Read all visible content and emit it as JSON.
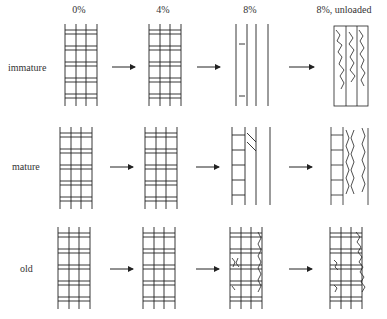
{
  "figure": {
    "columns": [
      {
        "label": "0%",
        "x": 70
      },
      {
        "label": "4%",
        "x": 163
      },
      {
        "label": "8%",
        "x": 250
      },
      {
        "label": "8%, unloaded",
        "x": 344
      }
    ],
    "rows": [
      {
        "label": "immature",
        "y": 65
      },
      {
        "label": "mature",
        "y": 168
      },
      {
        "label": "old",
        "y": 267
      }
    ],
    "arrow_count": 9,
    "line_color": "#222222"
  }
}
